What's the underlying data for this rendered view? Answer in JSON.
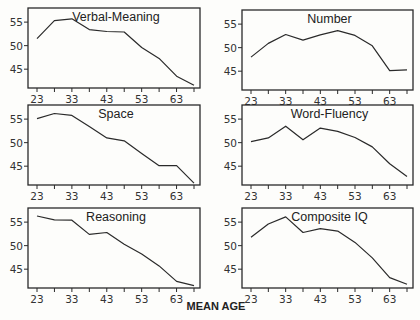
{
  "chart_data": {
    "type": "line",
    "xlabel": "MEAN AGE",
    "x": [
      23,
      28,
      33,
      38,
      43,
      48,
      53,
      58,
      63,
      68
    ],
    "x_tick_labels": [
      23,
      33,
      43,
      53,
      63
    ],
    "y_tick_labels": [
      45,
      50,
      55
    ],
    "ylim": [
      41,
      58
    ],
    "grid": false,
    "legend": null,
    "panels": [
      {
        "title": "Verbal-Meaning",
        "values": [
          51.5,
          55.3,
          55.7,
          53.4,
          53.0,
          52.9,
          49.6,
          47.3,
          43.5,
          41.6
        ]
      },
      {
        "title": "Number",
        "values": [
          48.0,
          50.9,
          52.8,
          51.6,
          52.7,
          53.6,
          52.6,
          50.4,
          45.1,
          45.3
        ]
      },
      {
        "title": "Space",
        "values": [
          55.1,
          56.2,
          55.8,
          53.4,
          51.0,
          50.4,
          47.7,
          45.1,
          45.1,
          41.4
        ]
      },
      {
        "title": "Word-Fluency",
        "values": [
          50.2,
          51.0,
          53.5,
          50.6,
          53.1,
          52.4,
          51.1,
          49.1,
          45.5,
          42.8
        ]
      },
      {
        "title": "Reasoning",
        "values": [
          56.3,
          55.5,
          55.4,
          52.4,
          52.8,
          50.3,
          48.2,
          45.7,
          42.4,
          41.5
        ]
      },
      {
        "title": "Composite IQ",
        "values": [
          51.8,
          54.6,
          56.1,
          52.8,
          53.6,
          53.1,
          50.7,
          47.4,
          43.2,
          41.8
        ]
      }
    ]
  },
  "layout": {
    "frames": [
      {
        "x0": 28,
        "x1": 200,
        "y0": 8,
        "y1": 88
      },
      {
        "x0": 242,
        "x1": 413,
        "y0": 10,
        "y1": 90
      },
      {
        "x0": 28,
        "x1": 200,
        "y0": 105,
        "y1": 185
      },
      {
        "x0": 242,
        "x1": 413,
        "y0": 105,
        "y1": 185
      },
      {
        "x0": 28,
        "x1": 200,
        "y0": 208,
        "y1": 288
      },
      {
        "x0": 242,
        "x1": 413,
        "y0": 208,
        "y1": 288
      }
    ],
    "colors": {
      "line": "#2a2a2a",
      "frame": "#2a2a2a",
      "background": "#fdfdfb"
    }
  }
}
